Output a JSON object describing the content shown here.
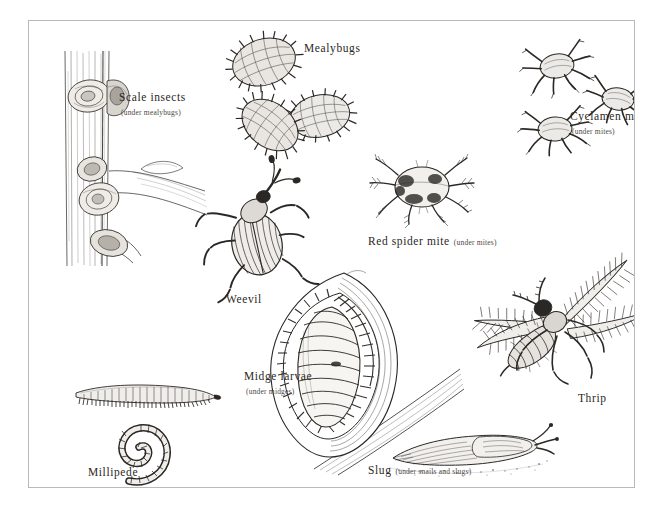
{
  "plate": {
    "kind": "botanical-pest-identification-plate",
    "style": "pen-and-ink line drawings, black on white",
    "border_color": "#b9b9bc",
    "ink_color": "#2a2724",
    "background": "#ffffff"
  },
  "labels": [
    {
      "id": "scale-insects",
      "main": "Scale insects",
      "sub": "(under mealybugs)",
      "sub_style": "stacked",
      "x": 118,
      "y": 86
    },
    {
      "id": "mealybugs",
      "main": "Mealybugs",
      "sub": "",
      "sub_style": "none",
      "x": 303,
      "y": 37
    },
    {
      "id": "cyclamen-mites",
      "main": "Cyclamen mites",
      "sub": "(under mites)",
      "sub_style": "stacked",
      "x": 569,
      "y": 105
    },
    {
      "id": "red-spider-mite",
      "main": "Red spider mite",
      "sub": "(under mites)",
      "sub_style": "inline",
      "x": 367,
      "y": 230
    },
    {
      "id": "weevil",
      "main": "Weevil",
      "sub": "",
      "sub_style": "none",
      "x": 225,
      "y": 288
    },
    {
      "id": "midge-larvae",
      "main": "Midge larvae",
      "sub": "(under midges)",
      "sub_style": "stacked",
      "x": 243,
      "y": 365
    },
    {
      "id": "thrip",
      "main": "Thrip",
      "sub": "",
      "sub_style": "none",
      "x": 577,
      "y": 387
    },
    {
      "id": "millipede",
      "main": "Millipede",
      "sub": "",
      "sub_style": "none",
      "x": 87,
      "y": 461
    },
    {
      "id": "slug",
      "main": "Slug",
      "sub": "(under snails and slugs)",
      "sub_style": "inline",
      "x": 367,
      "y": 459
    }
  ],
  "figures": [
    {
      "id": "scale-insects-on-stem",
      "name": "scale-insects-illustration",
      "count": 5,
      "x": 36,
      "y": 50,
      "w": 140,
      "h": 200
    },
    {
      "id": "mealybugs-group",
      "name": "mealybugs-illustration",
      "count": 3,
      "x": 218,
      "y": 28,
      "w": 130,
      "h": 125
    },
    {
      "id": "cyclamen-mites-group",
      "name": "cyclamen-mites-illustration",
      "count": 3,
      "x": 508,
      "y": 30,
      "w": 125,
      "h": 105
    },
    {
      "id": "red-spider-mite",
      "name": "red-spider-mite-illustration",
      "count": 1,
      "x": 368,
      "y": 145,
      "w": 105,
      "h": 78
    },
    {
      "id": "weevil",
      "name": "weevil-illustration",
      "count": 1,
      "x": 196,
      "y": 190,
      "w": 98,
      "h": 90
    },
    {
      "id": "midge-larvae-in-gall",
      "name": "midge-larvae-illustration",
      "count": 1,
      "x": 225,
      "y": 258,
      "w": 200,
      "h": 190
    },
    {
      "id": "thrip",
      "name": "thrip-illustration",
      "count": 1,
      "x": 458,
      "y": 255,
      "w": 160,
      "h": 122
    },
    {
      "id": "millipede-straight",
      "name": "millipede-straight-illustration",
      "count": 1,
      "x": 57,
      "y": 366,
      "w": 135,
      "h": 30
    },
    {
      "id": "millipede-coiled",
      "name": "millipede-coiled-illustration",
      "count": 1,
      "x": 75,
      "y": 400,
      "w": 80,
      "h": 60
    },
    {
      "id": "slug",
      "name": "slug-illustration",
      "count": 1,
      "x": 380,
      "y": 414,
      "w": 150,
      "h": 45
    }
  ]
}
